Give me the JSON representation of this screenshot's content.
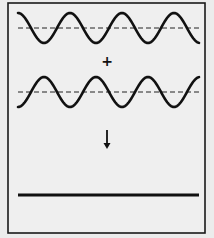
{
  "diagram": {
    "type": "wave-superposition",
    "colors": {
      "background": "#ececec",
      "panel": "#efefef",
      "stroke": "#111111",
      "border": "#1a1a1a"
    },
    "frame": {
      "x": 8,
      "y": 3,
      "width": 197,
      "height": 230
    },
    "wave_x_start": 18,
    "wave_x_end": 199,
    "period": 52,
    "amplitude": 15,
    "waves": [
      {
        "name": "wave-top",
        "baseline_y": 28,
        "phase": "starts-at-crest"
      },
      {
        "name": "wave-bottom",
        "baseline_y": 92,
        "phase": "starts-at-trough"
      }
    ],
    "operator_symbol": "+",
    "operator_position": {
      "x": 107,
      "y": 61
    },
    "arrow": {
      "x": 107,
      "y1": 130,
      "y2": 149,
      "symbol": "↓"
    },
    "result": {
      "y": 195,
      "x1": 18,
      "x2": 199,
      "label": "flat line (zero amplitude)"
    }
  }
}
